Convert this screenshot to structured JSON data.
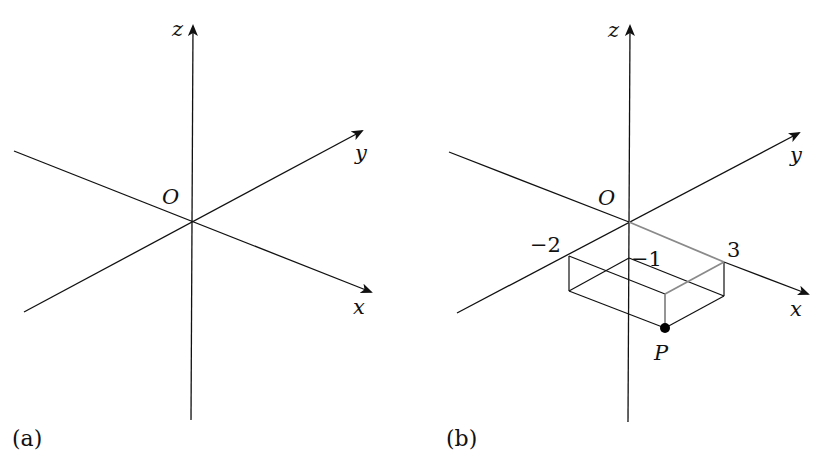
{
  "figure": {
    "panels": [
      {
        "id": "a",
        "label": "(a)",
        "origin_label": "O",
        "axes": {
          "x": "x",
          "y": "y",
          "z": "z"
        }
      },
      {
        "id": "b",
        "label": "(b)",
        "origin_label": "O",
        "axes": {
          "x": "x",
          "y": "y",
          "z": "z"
        },
        "tick_labels": {
          "y": "−2",
          "z": "−1",
          "x": "3"
        },
        "point": {
          "name": "P",
          "coords": [
            3,
            -2,
            -1
          ]
        }
      }
    ],
    "colors": {
      "axis": "#111111",
      "box_edge": "#111111",
      "highlight_path": "#8a8a8a",
      "point": "#000000"
    }
  }
}
